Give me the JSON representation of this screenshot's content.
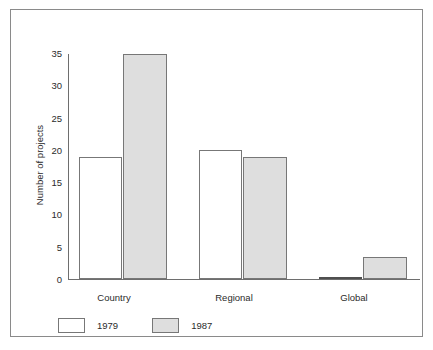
{
  "chart_data": {
    "type": "bar",
    "title": "",
    "subtitle": "",
    "xlabel": "",
    "ylabel": "Number of projects",
    "categories": [
      "Country",
      "Regional",
      "Global"
    ],
    "series": [
      {
        "name": "1979",
        "values": [
          19,
          20,
          0
        ],
        "color": "#ffffff"
      },
      {
        "name": "1987",
        "values": [
          35,
          19,
          3.5
        ],
        "color": "#dedede"
      }
    ],
    "ylim": [
      0,
      35
    ],
    "yticks": [
      0,
      5,
      10,
      15,
      20,
      25,
      30,
      35
    ],
    "ytick_labels": [
      "0",
      "5",
      "10",
      "15",
      "20",
      "25",
      "30",
      "35"
    ],
    "grid": false,
    "legend_position": "bottom-left",
    "legend": [
      "1979",
      "1987"
    ],
    "border_color": "#8a8a8a",
    "axis_color": "#6e6e6e",
    "bar_outline_color": "#777777"
  }
}
